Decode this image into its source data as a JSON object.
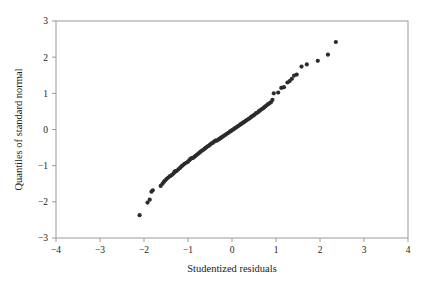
{
  "figure": {
    "name": "normal-qq-plot",
    "background": "#ffffff",
    "frame_color": "#9a9a9a",
    "point_color": "#2b2b2b",
    "text_color": "#1a1a1a"
  },
  "chart_data": {
    "type": "scatter",
    "title": "",
    "xlabel": "Studentized residuals",
    "ylabel": "Quantiles of standard normal",
    "xlim": [
      -4,
      4
    ],
    "ylim": [
      -3,
      3
    ],
    "xticks": [
      -4,
      -3,
      -2,
      -1,
      0,
      1,
      2,
      3,
      4
    ],
    "yticks": [
      -3,
      -2,
      -1,
      0,
      1,
      2,
      3
    ],
    "xticklabels": [
      "−4",
      "−3",
      "−2",
      "−1",
      "0",
      "1",
      "2",
      "3",
      "4"
    ],
    "yticklabels": [
      "−3",
      "−2",
      "−1",
      "0",
      "1",
      "2",
      "3"
    ],
    "grid": false,
    "legend": null,
    "marker": "filled-circle",
    "marker_size_px": 4.2,
    "series": [
      {
        "name": "studentized residuals vs normal quantiles",
        "x": [
          -2.1,
          -1.92,
          -1.87,
          -1.83,
          -1.8,
          -1.62,
          -1.58,
          -1.55,
          -1.52,
          -1.49,
          -1.45,
          -1.41,
          -1.37,
          -1.33,
          -1.31,
          -1.29,
          -1.26,
          -1.22,
          -1.18,
          -1.15,
          -1.12,
          -1.08,
          -1.04,
          -1.0,
          -0.97,
          -0.95,
          -0.92,
          -0.89,
          -0.86,
          -0.83,
          -0.8,
          -0.77,
          -0.74,
          -0.71,
          -0.68,
          -0.65,
          -0.62,
          -0.59,
          -0.56,
          -0.53,
          -0.5,
          -0.47,
          -0.44,
          -0.41,
          -0.38,
          -0.35,
          -0.32,
          -0.29,
          -0.26,
          -0.23,
          -0.2,
          -0.17,
          -0.14,
          -0.11,
          -0.08,
          -0.05,
          -0.02,
          0.01,
          0.04,
          0.07,
          0.1,
          0.13,
          0.16,
          0.19,
          0.22,
          0.25,
          0.28,
          0.31,
          0.34,
          0.37,
          0.4,
          0.43,
          0.46,
          0.49,
          0.52,
          0.55,
          0.58,
          0.61,
          0.64,
          0.67,
          0.7,
          0.73,
          0.76,
          0.79,
          0.82,
          0.86,
          0.89,
          0.92,
          0.95,
          1.05,
          1.12,
          1.18,
          1.26,
          1.31,
          1.36,
          1.41,
          1.47,
          1.58,
          1.7,
          1.95,
          2.18,
          2.36
        ],
        "y": [
          -2.37,
          -2.02,
          -1.94,
          -1.72,
          -1.68,
          -1.56,
          -1.5,
          -1.45,
          -1.41,
          -1.37,
          -1.33,
          -1.29,
          -1.26,
          -1.22,
          -1.18,
          -1.15,
          -1.15,
          -1.1,
          -1.06,
          -1.02,
          -0.99,
          -0.95,
          -0.92,
          -0.89,
          -0.85,
          -0.82,
          -0.79,
          -0.79,
          -0.76,
          -0.73,
          -0.7,
          -0.67,
          -0.64,
          -0.61,
          -0.58,
          -0.56,
          -0.53,
          -0.5,
          -0.47,
          -0.45,
          -0.42,
          -0.39,
          -0.37,
          -0.34,
          -0.31,
          -0.31,
          -0.29,
          -0.26,
          -0.24,
          -0.21,
          -0.19,
          -0.16,
          -0.14,
          -0.11,
          -0.09,
          -0.06,
          -0.04,
          -0.01,
          0.01,
          0.04,
          0.06,
          0.09,
          0.11,
          0.14,
          0.16,
          0.19,
          0.21,
          0.24,
          0.26,
          0.29,
          0.31,
          0.34,
          0.37,
          0.39,
          0.42,
          0.45,
          0.47,
          0.5,
          0.53,
          0.56,
          0.58,
          0.61,
          0.64,
          0.67,
          0.7,
          0.73,
          0.76,
          0.82,
          1.0,
          1.02,
          1.15,
          1.17,
          1.3,
          1.34,
          1.4,
          1.49,
          1.52,
          1.74,
          1.8,
          1.9,
          2.07,
          2.42
        ]
      }
    ]
  }
}
